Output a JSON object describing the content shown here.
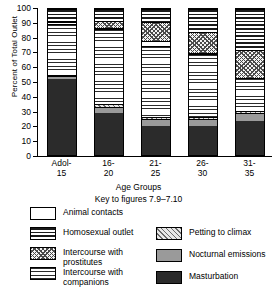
{
  "chart_data": {
    "type": "bar",
    "subtype": "stacked-bar-100-percent",
    "title": "",
    "xlabel": "Age Groups",
    "ylabel": "Percent of Total Outlet",
    "ylim": [
      0,
      100
    ],
    "yticks": [
      100,
      90,
      80,
      70,
      60,
      50,
      40,
      30,
      20,
      10,
      0
    ],
    "grid": false,
    "legend_position": "below",
    "categories": [
      "Adol-\n15",
      "16-\n20",
      "21-\n25",
      "26-\n30",
      "31-\n35"
    ],
    "category_labels_flat": [
      "Adol-15",
      "16-20",
      "21-25",
      "26-30",
      "31-35"
    ],
    "series": [
      {
        "name": "Masturbation",
        "key": "mast",
        "values": [
          52,
          29,
          20,
          20,
          23
        ]
      },
      {
        "name": "Nocturnal emissions",
        "key": "noct",
        "values": [
          2,
          4,
          5,
          5,
          6
        ]
      },
      {
        "name": "Petting to climax",
        "key": "pet",
        "values": [
          1,
          2,
          1,
          1,
          1
        ]
      },
      {
        "name": "Intercourse with companions",
        "key": "comp",
        "values": [
          35,
          51,
          49,
          43,
          23
        ]
      },
      {
        "name": "Animal contacts",
        "key": "animal",
        "values": [
          1,
          1,
          3,
          1,
          0
        ]
      },
      {
        "name": "Intercourse with prostitutes",
        "key": "prost",
        "values": [
          1,
          5,
          13,
          14,
          19
        ]
      },
      {
        "name": "Homosexual outlet",
        "key": "homo",
        "values": [
          8,
          8,
          9,
          16,
          28
        ]
      }
    ],
    "stack_order_bottom_to_top": [
      "Masturbation",
      "Nocturnal emissions",
      "Petting to climax",
      "Intercourse with companions",
      "Animal contacts",
      "Intercourse with prostitutes",
      "Homosexual outlet"
    ],
    "colors": {
      "masturbation": "#2b2b2b",
      "nocturnal_emissions": "#9a9a9a",
      "petting_to_climax": "#e8e8e8",
      "intercourse_with_companions": "#ffffff",
      "animal_contacts": "#ffffff",
      "intercourse_with_prostitutes": "#f2f2f2",
      "homosexual_outlet": "#ffffff",
      "axis": "#000000",
      "background": "#ffffff"
    }
  },
  "axis": {
    "ylabel": "Percent of Total Outlet",
    "xlabel": "Age Groups",
    "yticks": [
      "100",
      "90",
      "80",
      "70",
      "60",
      "50",
      "40",
      "30",
      "20",
      "10",
      "0"
    ],
    "xticks": [
      {
        "line1": "Adol-",
        "line2": "15"
      },
      {
        "line1": "16-",
        "line2": "20"
      },
      {
        "line1": "21-",
        "line2": "25"
      },
      {
        "line1": "26-",
        "line2": "30"
      },
      {
        "line1": "31-",
        "line2": "35"
      }
    ]
  },
  "captions": {
    "age_groups": "Age Groups",
    "key_to_figures": "Key to figures 7.9–7.10"
  },
  "legend": {
    "left": [
      {
        "label": "Animal contacts",
        "pattern": "p-animal"
      },
      {
        "label": "Homosexual outlet",
        "pattern": "p-homo"
      },
      {
        "label": "Intercourse with\nprostitutes",
        "pattern": "p-prost"
      },
      {
        "label": "Intercourse with\ncompanions",
        "pattern": "p-comp"
      }
    ],
    "right": [
      {
        "label": "Petting to climax",
        "pattern": "p-pet"
      },
      {
        "label": "Nocturnal emissions",
        "pattern": "p-noct"
      },
      {
        "label": "Masturbation",
        "pattern": "p-mast"
      }
    ]
  }
}
